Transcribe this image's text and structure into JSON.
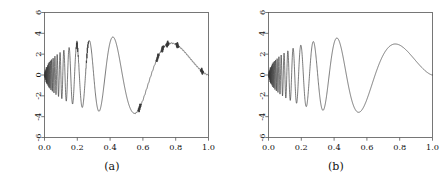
{
  "figure": {
    "background_color": "#ffffff",
    "line_color": "#333333",
    "axis_color": "#555555",
    "panels": [
      {
        "id": "a",
        "caption": "(a)"
      },
      {
        "id": "b",
        "caption": "(b)"
      }
    ]
  },
  "chart_data": [
    {
      "type": "line",
      "panel": "a",
      "title": "",
      "subtitle": "",
      "xlabel": "",
      "ylabel": "",
      "xlim": [
        0.0,
        1.0
      ],
      "ylim": [
        -6,
        6
      ],
      "grid": false,
      "legend": "none",
      "xticks": [
        0.0,
        0.2,
        0.4,
        0.6,
        0.8,
        1.0
      ],
      "xtick_labels": [
        "0.0",
        "0.2",
        "0.4",
        "0.6",
        "0.8",
        "1.0"
      ],
      "yticks": [
        -6,
        -4,
        -2,
        0,
        2,
        4,
        6
      ],
      "ytick_labels": [
        "-6",
        "-4",
        "-2",
        "0",
        "2",
        "4",
        "6"
      ],
      "series": [
        {
          "name": "reconstructed doppler signal",
          "description": "Doppler test function with residual reconstruction artifacts (small kinks and spikes)",
          "formula": "y = 24*sqrt(x*(1-x))*sin(2*pi*1.05/(x+0.05))",
          "amplitude_envelope_peak": 3.7,
          "artifact_locations_x": [
            0.2,
            0.26,
            0.58,
            0.69,
            0.72,
            0.75,
            0.81,
            0.96
          ],
          "x": [
            0.0,
            0.01,
            0.02,
            0.03,
            0.04,
            0.05,
            0.06,
            0.07,
            0.08,
            0.09,
            0.1,
            0.12,
            0.14,
            0.16,
            0.18,
            0.2,
            0.22,
            0.24,
            0.26,
            0.28,
            0.3,
            0.32,
            0.34,
            0.36,
            0.38,
            0.4,
            0.42,
            0.45,
            0.48,
            0.5,
            0.52,
            0.55,
            0.58,
            0.6,
            0.65,
            0.7,
            0.75,
            0.8,
            0.85,
            0.9,
            0.95,
            1.0
          ],
          "y": [
            0.0,
            0.3,
            -0.85,
            0.95,
            -1.1,
            1.35,
            -1.45,
            1.6,
            -1.7,
            1.95,
            -2.05,
            2.6,
            -2.7,
            3.0,
            -3.1,
            3.55,
            -3.55,
            3.45,
            3.2,
            -3.45,
            -2.2,
            1.0,
            2.9,
            3.3,
            3.55,
            3.4,
            2.4,
            -1.6,
            -3.4,
            -3.85,
            -3.95,
            -3.7,
            -2.5,
            -1.7,
            0.6,
            2.55,
            3.05,
            3.25,
            3.0,
            2.2,
            1.2,
            0.2
          ]
        }
      ]
    },
    {
      "type": "line",
      "panel": "b",
      "title": "",
      "subtitle": "",
      "xlabel": "",
      "ylabel": "",
      "xlim": [
        0.0,
        1.0
      ],
      "ylim": [
        -6,
        6
      ],
      "grid": false,
      "legend": "none",
      "xticks": [
        0.0,
        0.2,
        0.4,
        0.6,
        0.8,
        1.0
      ],
      "xtick_labels": [
        "0.0",
        "0.2",
        "0.4",
        "0.6",
        "0.8",
        "1.0"
      ],
      "yticks": [
        -6,
        -4,
        -2,
        0,
        2,
        4,
        6
      ],
      "ytick_labels": [
        "-6",
        "-4",
        "-2",
        "0",
        "2",
        "4",
        "6"
      ],
      "series": [
        {
          "name": "true doppler signal",
          "description": "Smooth Doppler test function without artifacts",
          "formula": "y = 24*sqrt(x*(1-x))*sin(2*pi*1.05/(x+0.05))",
          "amplitude_envelope_peak": 3.6,
          "artifact_locations_x": [],
          "x": [
            0.0,
            0.01,
            0.02,
            0.03,
            0.04,
            0.05,
            0.06,
            0.07,
            0.08,
            0.09,
            0.1,
            0.12,
            0.14,
            0.16,
            0.18,
            0.2,
            0.22,
            0.24,
            0.26,
            0.28,
            0.3,
            0.32,
            0.34,
            0.36,
            0.38,
            0.4,
            0.42,
            0.45,
            0.48,
            0.5,
            0.52,
            0.55,
            0.58,
            0.6,
            0.65,
            0.7,
            0.75,
            0.8,
            0.85,
            0.9,
            0.95,
            1.0
          ],
          "y": [
            0.0,
            0.25,
            -0.8,
            0.9,
            -1.05,
            1.3,
            -1.4,
            1.55,
            -1.65,
            1.9,
            -2.0,
            2.55,
            -2.65,
            2.95,
            -3.05,
            3.45,
            -3.35,
            3.4,
            3.45,
            -3.4,
            -2.1,
            1.05,
            2.85,
            3.25,
            3.5,
            3.35,
            2.35,
            -1.55,
            -3.35,
            -3.8,
            -3.9,
            -3.65,
            -2.45,
            -1.65,
            0.65,
            2.5,
            3.0,
            3.15,
            2.85,
            2.0,
            1.0,
            0.15
          ]
        }
      ]
    }
  ],
  "plot_geometry": {
    "panel_a": {
      "left": 44,
      "top": 12,
      "right": 208,
      "bottom": 137
    },
    "panel_b": {
      "left": 268,
      "top": 12,
      "right": 432,
      "bottom": 137
    }
  }
}
